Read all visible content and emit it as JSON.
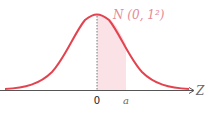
{
  "diagram": {
    "title_label": "N (0,  1²)",
    "axis_label": "Z",
    "origin_label": "0",
    "bound_label": "a",
    "colors": {
      "curve": "#e2434f",
      "shade": "#fbe2e7",
      "title": "#e58a96",
      "axis": "#555555",
      "dotted": "#777777"
    }
  }
}
